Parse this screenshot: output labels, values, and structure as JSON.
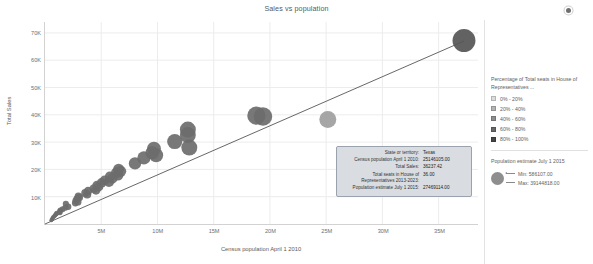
{
  "header": {
    "title": "Sales vs population",
    "menu_icon": "more-options-icon"
  },
  "chart_data": {
    "type": "scatter",
    "title": "Sales vs population",
    "xlabel": "Census population April 1 2010",
    "ylabel": "Total Sales",
    "xlim": [
      0,
      38500000
    ],
    "ylim": [
      0,
      74000
    ],
    "grid": true,
    "x_ticks": [
      "5M",
      "10M",
      "15M",
      "20M",
      "25M",
      "30M",
      "35M"
    ],
    "x_tick_values": [
      5000000,
      10000000,
      15000000,
      20000000,
      25000000,
      30000000,
      35000000
    ],
    "y_ticks": [
      "10K",
      "20K",
      "30K",
      "40K",
      "50K",
      "60K",
      "70K"
    ],
    "y_tick_values": [
      10000,
      20000,
      30000,
      40000,
      50000,
      60000,
      70000
    ],
    "trendline": {
      "x0": 0,
      "y0": 0,
      "x1": 37253956,
      "y1": 67000
    },
    "points": [
      {
        "x": 563626,
        "y": 1400,
        "r": 2.0,
        "c": "#6d6d6d"
      },
      {
        "x": 625741,
        "y": 1700,
        "r": 2.0,
        "c": "#6d6d6d"
      },
      {
        "x": 672591,
        "y": 2100,
        "r": 2.1,
        "c": "#6d6d6d"
      },
      {
        "x": 710231,
        "y": 2400,
        "r": 2.1,
        "c": "#6d6d6d"
      },
      {
        "x": 814180,
        "y": 2800,
        "r": 2.2,
        "c": "#6d6d6d"
      },
      {
        "x": 897934,
        "y": 3200,
        "r": 2.3,
        "c": "#6d6d6d"
      },
      {
        "x": 989415,
        "y": 3600,
        "r": 2.4,
        "c": "#6d6d6d"
      },
      {
        "x": 1052567,
        "y": 3900,
        "r": 2.5,
        "c": "#6d6d6d"
      },
      {
        "x": 1316470,
        "y": 4600,
        "r": 2.7,
        "c": "#6d6d6d"
      },
      {
        "x": 1328361,
        "y": 4200,
        "r": 2.7,
        "c": "#6d6d6d"
      },
      {
        "x": 1360301,
        "y": 5000,
        "r": 2.8,
        "c": "#6d6d6d"
      },
      {
        "x": 1567582,
        "y": 5400,
        "r": 2.9,
        "c": "#6d6d6d"
      },
      {
        "x": 1826341,
        "y": 6000,
        "r": 3.1,
        "c": "#6d6d6d"
      },
      {
        "x": 1852994,
        "y": 7400,
        "r": 3.1,
        "c": "#6d6d6d"
      },
      {
        "x": 2059179,
        "y": 6300,
        "r": 3.2,
        "c": "#6d6d6d"
      },
      {
        "x": 2700551,
        "y": 7700,
        "r": 3.5,
        "c": "#6d6d6d"
      },
      {
        "x": 2763885,
        "y": 8600,
        "r": 3.6,
        "c": "#6d6d6d"
      },
      {
        "x": 2853118,
        "y": 9200,
        "r": 3.6,
        "c": "#6d6d6d"
      },
      {
        "x": 2915918,
        "y": 8100,
        "r": 3.7,
        "c": "#6d6d6d"
      },
      {
        "x": 2967297,
        "y": 10200,
        "r": 3.7,
        "c": "#6d6d6d"
      },
      {
        "x": 3046355,
        "y": 9700,
        "r": 3.8,
        "c": "#6d6d6d"
      },
      {
        "x": 3574097,
        "y": 11400,
        "r": 4.0,
        "c": "#6d6d6d"
      },
      {
        "x": 3751351,
        "y": 10800,
        "r": 4.1,
        "c": "#6d6d6d"
      },
      {
        "x": 3831074,
        "y": 12100,
        "r": 4.2,
        "c": "#6d6d6d"
      },
      {
        "x": 4339367,
        "y": 13000,
        "r": 4.4,
        "c": "#6d6d6d"
      },
      {
        "x": 4533372,
        "y": 12400,
        "r": 4.5,
        "c": "#6d6d6d"
      },
      {
        "x": 4625364,
        "y": 14200,
        "r": 4.6,
        "c": "#6d6d6d"
      },
      {
        "x": 4779736,
        "y": 13600,
        "r": 4.6,
        "c": "#6d6d6d"
      },
      {
        "x": 5029196,
        "y": 15100,
        "r": 4.8,
        "c": "#6d6d6d"
      },
      {
        "x": 5303925,
        "y": 16000,
        "r": 4.9,
        "c": "#6d6d6d"
      },
      {
        "x": 5686986,
        "y": 15400,
        "r": 5.1,
        "c": "#6d6d6d"
      },
      {
        "x": 5773552,
        "y": 17400,
        "r": 5.1,
        "c": "#6d6d6d"
      },
      {
        "x": 5988927,
        "y": 16700,
        "r": 5.2,
        "c": "#6d6d6d"
      },
      {
        "x": 6346105,
        "y": 18800,
        "r": 5.4,
        "c": "#6d6d6d"
      },
      {
        "x": 6483802,
        "y": 17900,
        "r": 5.5,
        "c": "#6d6d6d"
      },
      {
        "x": 6547629,
        "y": 20100,
        "r": 5.5,
        "c": "#6d6d6d"
      },
      {
        "x": 6724540,
        "y": 19300,
        "r": 5.6,
        "c": "#6d6d6d"
      },
      {
        "x": 8001024,
        "y": 22200,
        "r": 6.2,
        "c": "#6d6d6d"
      },
      {
        "x": 8791894,
        "y": 24200,
        "r": 6.6,
        "c": "#6d6d6d"
      },
      {
        "x": 9535483,
        "y": 26100,
        "r": 6.9,
        "c": "#6d6d6d"
      },
      {
        "x": 9687653,
        "y": 27600,
        "r": 7.0,
        "c": "#6d6d6d"
      },
      {
        "x": 9883640,
        "y": 25200,
        "r": 7.0,
        "c": "#6d6d6d"
      },
      {
        "x": 11536504,
        "y": 30200,
        "r": 7.6,
        "c": "#6d6d6d"
      },
      {
        "x": 12702379,
        "y": 32600,
        "r": 8.0,
        "c": "#6d6d6d"
      },
      {
        "x": 12830632,
        "y": 28000,
        "r": 8.0,
        "c": "#6d6d6d"
      },
      {
        "x": 12702000,
        "y": 34600,
        "r": 8.0,
        "c": "#6d6d6d"
      },
      {
        "x": 18801310,
        "y": 39700,
        "r": 9.2,
        "c": "#6d6d6d"
      },
      {
        "x": 19378102,
        "y": 39400,
        "r": 9.3,
        "c": "#6d6d6d"
      },
      {
        "x": 25145561,
        "y": 38300,
        "r": 8.5,
        "c": "#9e9e9e"
      },
      {
        "x": 37253956,
        "y": 67200,
        "r": 11.5,
        "c": "#555555"
      }
    ]
  },
  "tooltip": {
    "rows": [
      {
        "label": "State or territory:",
        "value": "Texas"
      },
      {
        "label": "Census population April 1 2010:",
        "value": "25146105.00"
      },
      {
        "label": "Total Sales:",
        "value": "36237.42"
      },
      {
        "label": "Total seats in House of Representatives 2013-2023:",
        "value": "36.00"
      },
      {
        "label": "Population estimate July 1 2015:",
        "value": "27469114.00"
      }
    ]
  },
  "legend": {
    "color": {
      "title": "Percentage of Total seats in House of Representatives ...",
      "items": [
        {
          "label": "0% - 20%",
          "color": "#dcdcdc"
        },
        {
          "label": "20% - 40%",
          "color": "#b4b4b4"
        },
        {
          "label": "40% - 60%",
          "color": "#8e8e8e"
        },
        {
          "label": "60% - 80%",
          "color": "#686868"
        },
        {
          "label": "80% - 100%",
          "color": "#464646"
        }
      ]
    },
    "size": {
      "title": "Population estimate July 1 2015",
      "min_label": "Min: 586107.00",
      "max_label": "Max: 39144818.00"
    }
  }
}
